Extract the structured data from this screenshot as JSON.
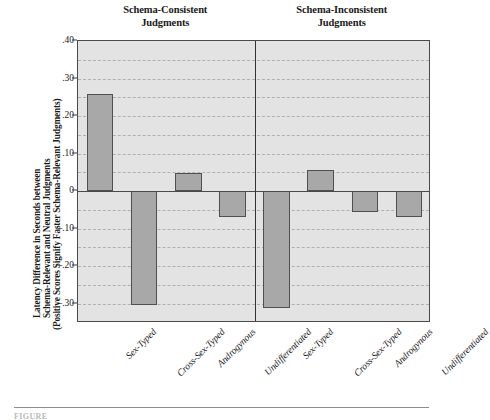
{
  "figure": {
    "y_axis_title_lines": [
      "Latency Difference in Seconds between",
      "Schema-Relevant and Neutral Judgments",
      "(Positive Scores Signify Faster Schema-Relevant Judgments)"
    ],
    "caption": "FIGURE"
  },
  "colors": {
    "bar_fill": "#a8a8a8",
    "bar_border": "#4f4f4f",
    "plot_background": "#e3e3e3",
    "frame": "#4a4a4a",
    "gridline": "#9aa0b0",
    "divider": "#333333"
  },
  "chart_data": {
    "type": "bar",
    "title": "",
    "xlabel": "",
    "ylabel": "Latency Difference in Seconds between Schema-Relevant and Neutral Judgments (Positive Scores Signify Faster Schema-Relevant Judgments)",
    "ylim": [
      -0.352,
      0.4
    ],
    "grid": true,
    "grid_interval": 0.05,
    "legend": "none",
    "y_ticks": [
      0.4,
      0.3,
      0.2,
      0.1,
      0,
      -0.1,
      -0.2,
      -0.3
    ],
    "y_tick_labels": [
      ".40",
      ".30",
      ".20",
      ".10",
      "0",
      "–.10",
      "–.20",
      "–.30"
    ],
    "categories": [
      "Sex-Typed",
      "Cross-Sex-Typed",
      "Androgynous",
      "Undifferentiated"
    ],
    "panels": [
      {
        "title_lines": [
          "Schema-Consistent",
          "Judgments"
        ],
        "title": "Schema-Consistent Judgments",
        "values": [
          0.258,
          -0.305,
          0.048,
          -0.068
        ]
      },
      {
        "title_lines": [
          "Schema-Inconsistent",
          "Judgments"
        ],
        "title": "Schema-Inconsistent Judgments",
        "values": [
          -0.312,
          0.057,
          -0.055,
          -0.07
        ]
      }
    ]
  }
}
